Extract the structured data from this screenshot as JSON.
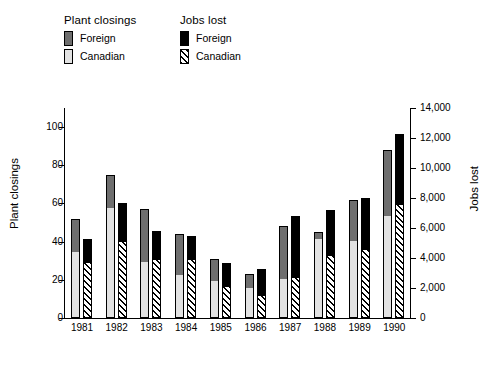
{
  "legend": {
    "plant": {
      "title": "Plant closings",
      "items": [
        {
          "label": "Foreign",
          "swatch": "dark-gray-solid",
          "color": "#6e6e6e"
        },
        {
          "label": "Canadian",
          "swatch": "light-gray-solid",
          "color": "#e2e2e2"
        }
      ]
    },
    "jobs": {
      "title": "Jobs lost",
      "items": [
        {
          "label": "Foreign",
          "swatch": "black-solid",
          "color": "#000000"
        },
        {
          "label": "Canadian",
          "swatch": "diagonal-hatch",
          "color": "#000000"
        }
      ]
    }
  },
  "chart_data": {
    "type": "bar",
    "title": "",
    "xlabel": "",
    "ylabel": "Plant closings",
    "y2label": "Jobs lost",
    "ylim": [
      0,
      110
    ],
    "y2lim": [
      0,
      14000
    ],
    "yticks": [
      0,
      20,
      40,
      60,
      80,
      100
    ],
    "yticklabels": [
      "0",
      "20",
      "40",
      "60",
      "80",
      "100"
    ],
    "y2ticks": [
      0,
      2000,
      4000,
      6000,
      8000,
      10000,
      12000,
      14000
    ],
    "y2ticklabels": [
      "0",
      "2,000",
      "4,000",
      "6,000",
      "8,000",
      "10,000",
      "12,000",
      "14,000"
    ],
    "grid": false,
    "legend_position": "top-left",
    "categories": [
      "1981",
      "1982",
      "1983",
      "1984",
      "1985",
      "1986",
      "1987",
      "1988",
      "1989",
      "1990"
    ],
    "stacked": true,
    "series": [
      {
        "name": "Plant closings - Canadian",
        "axis": "left",
        "values": [
          34,
          57,
          29,
          22,
          19,
          15,
          20,
          41,
          40,
          53
        ]
      },
      {
        "name": "Plant closings - Foreign",
        "axis": "left",
        "values": [
          18,
          18,
          28,
          22,
          12,
          8,
          28,
          4,
          22,
          35
        ]
      },
      {
        "name": "Plant closings - Total",
        "axis": "left",
        "values": [
          52,
          75,
          57,
          44,
          31,
          23,
          48,
          45,
          62,
          88
        ]
      },
      {
        "name": "Jobs lost - Canadian",
        "axis": "right",
        "values": [
          3600,
          5000,
          3800,
          3800,
          2000,
          1400,
          2600,
          4100,
          4500,
          7500
        ]
      },
      {
        "name": "Jobs lost - Foreign",
        "axis": "right",
        "values": [
          1700,
          2700,
          2000,
          1700,
          1700,
          1900,
          4200,
          3100,
          3500,
          4800
        ]
      },
      {
        "name": "Jobs lost - Total",
        "axis": "right",
        "values": [
          5300,
          7700,
          5800,
          5500,
          3700,
          3300,
          6800,
          7200,
          8000,
          12300
        ]
      }
    ]
  }
}
